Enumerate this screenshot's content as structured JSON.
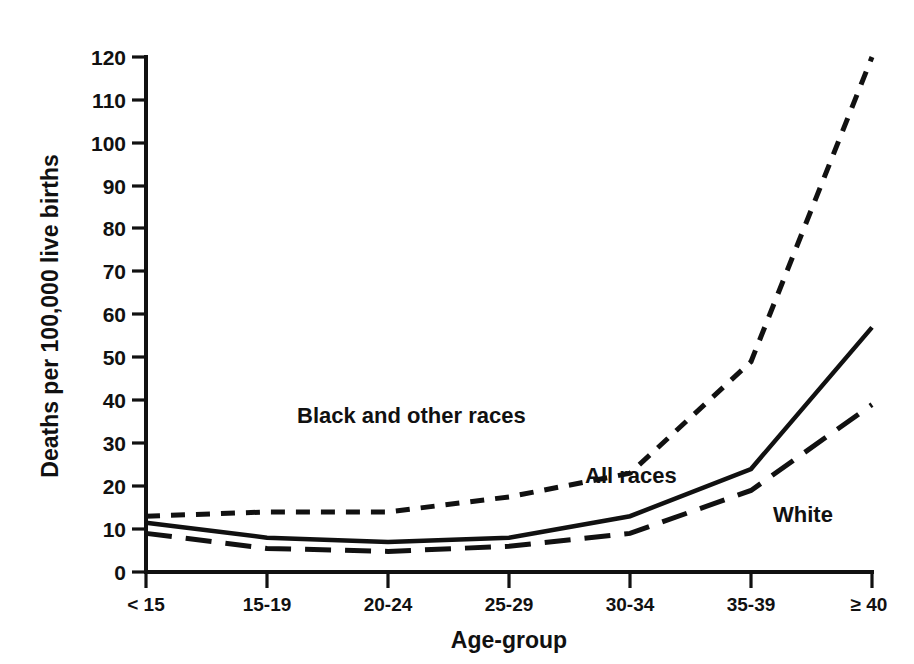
{
  "chart_data": {
    "type": "line",
    "title": "",
    "xlabel": "Age-group",
    "ylabel": "Deaths per 100,000 live births",
    "categories": [
      "< 15",
      "15-19",
      "20-24",
      "25-29",
      "30-34",
      "35-39",
      "≥ 40"
    ],
    "ylim": [
      0,
      120
    ],
    "yticks": [
      0,
      10,
      20,
      30,
      40,
      50,
      60,
      70,
      80,
      90,
      100,
      110,
      120
    ],
    "ytick_labels": [
      "0",
      "10",
      "20",
      "30",
      "40",
      "50",
      "60",
      "70",
      "80",
      "90",
      "100",
      "110",
      "120"
    ],
    "grid": false,
    "legend": "inline-annotations",
    "series": [
      {
        "name": "Black and other races",
        "style": "short-dashed",
        "color": "#111111",
        "values": [
          13,
          14,
          14,
          17.5,
          23,
          49,
          120
        ],
        "label_position": "upper-left"
      },
      {
        "name": "All races",
        "style": "solid",
        "color": "#111111",
        "values": [
          11.5,
          8,
          7,
          8,
          13,
          24,
          57
        ],
        "label_position": "mid-right"
      },
      {
        "name": "White",
        "style": "long-dashed",
        "color": "#111111",
        "values": [
          9,
          5.5,
          4.8,
          6,
          9,
          19,
          39
        ],
        "label_position": "lower-right"
      }
    ],
    "annotations": [
      {
        "text": "Black and other races",
        "x_category": "20-24",
        "y_value": 38
      },
      {
        "text": "All races",
        "x_category": "30-34",
        "y_value": 22
      },
      {
        "text": "White",
        "x_category": "35-39",
        "y_value": 13
      }
    ]
  },
  "axes": {
    "y_title": "Deaths per 100,000 live births",
    "x_title": "Age-group"
  }
}
